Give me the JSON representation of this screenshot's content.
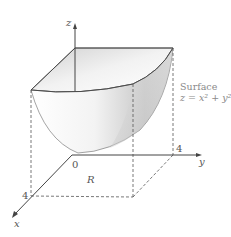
{
  "diagram": {
    "type": "3d-surface-plot",
    "surface": {
      "label": "Surface",
      "equation": "z = x² + y²"
    },
    "axes": {
      "x": {
        "label": "x",
        "tick": "4"
      },
      "y": {
        "label": "y",
        "tick": "4"
      },
      "z": {
        "label": "z"
      },
      "origin": "0"
    },
    "region": {
      "label": "R"
    },
    "colors": {
      "axis": "#444444",
      "surface_light": "#f4f4f4",
      "surface_shadow": "#b8b8b8",
      "dashed": "#555555",
      "text": "#555555",
      "label_gray": "#8a8a8a"
    }
  }
}
